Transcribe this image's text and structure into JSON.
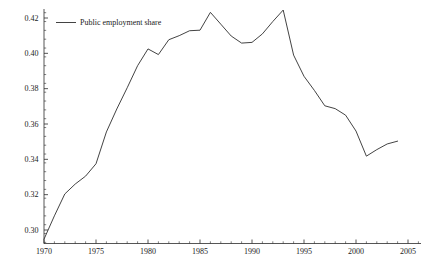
{
  "chart_data": {
    "type": "line",
    "title": "",
    "subtitle": "",
    "xlabel": "",
    "ylabel": "",
    "xlim": [
      1969.2,
      2006.0
    ],
    "ylim": [
      0.2925,
      0.4245
    ],
    "grid": false,
    "legend_position": "top-left",
    "x_major_ticks": [
      1970,
      1975,
      1980,
      1985,
      1990,
      1995,
      2000,
      2005
    ],
    "x_major_tick_labels": [
      "1970",
      "1975",
      "1980",
      "1985",
      "1990",
      "1995",
      "2000",
      "2005"
    ],
    "x_minor_tick_step": 1,
    "y_major_ticks": [
      0.3,
      0.32,
      0.34,
      0.36,
      0.38,
      0.4,
      0.42
    ],
    "y_major_tick_labels": [
      "0.30",
      "0.32",
      "0.34",
      "0.36",
      "0.38",
      "0.40",
      "0.42"
    ],
    "y_minor_tick_step": 0.005,
    "series": [
      {
        "name": "Public employment share",
        "color": "#2e2e2e",
        "x": [
          1970,
          1971,
          1972,
          1973,
          1974,
          1975,
          1976,
          1977,
          1978,
          1979,
          1980,
          1981,
          1982,
          1983,
          1984,
          1985,
          1986,
          1987,
          1988,
          1989,
          1990,
          1991,
          1992,
          1993,
          1994,
          1995,
          1996,
          1997,
          1998,
          1999,
          2000,
          2001,
          2002,
          2003,
          2004
        ],
        "values": [
          0.2948,
          0.308,
          0.3204,
          0.326,
          0.3305,
          0.3375,
          0.3555,
          0.3685,
          0.3805,
          0.393,
          0.4025,
          0.3993,
          0.4077,
          0.41,
          0.4128,
          0.4131,
          0.4232,
          0.4165,
          0.4098,
          0.4058,
          0.4062,
          0.411,
          0.418,
          0.4245,
          0.399,
          0.387,
          0.379,
          0.3703,
          0.3687,
          0.365,
          0.356,
          0.3418,
          0.3455,
          0.3487,
          0.3503
        ]
      }
    ]
  },
  "legend": {
    "entries": [
      {
        "label": "Public employment share",
        "marker": "line-swatch"
      }
    ]
  },
  "axes": {
    "y_axis_name": "y-axis",
    "x_axis_name": "x-axis"
  }
}
